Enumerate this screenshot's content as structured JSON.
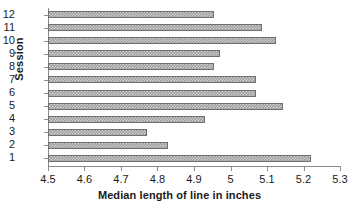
{
  "chart_data": {
    "type": "bar",
    "orientation": "horizontal",
    "title": "",
    "xlabel": "Median length of line in inches",
    "ylabel": "Session",
    "categories": [
      "1",
      "2",
      "3",
      "4",
      "5",
      "6",
      "7",
      "8",
      "9",
      "10",
      "11",
      "12"
    ],
    "values": [
      5.22,
      4.83,
      4.77,
      4.93,
      5.145,
      5.07,
      5.07,
      4.955,
      4.97,
      5.125,
      5.085,
      4.955
    ],
    "xlim": [
      4.5,
      5.3
    ],
    "xticks": [
      4.5,
      4.6,
      4.7,
      4.8,
      4.9,
      5,
      5.1,
      5.2,
      5.3
    ],
    "xtick_labels": [
      "4.5",
      "4.6",
      "4.7",
      "4.8",
      "4.9",
      "5",
      "5.1",
      "5.2",
      "5.3"
    ],
    "ytick_labels": [
      "12",
      "11",
      "10",
      "9",
      "8",
      "7",
      "6",
      "5",
      "4",
      "3",
      "2",
      "1"
    ],
    "grid": false,
    "legend": null,
    "bar_fill_color": "#9d9d9d",
    "bar_border_color": "#6f6f6f",
    "axis_color": "#8a8a8a",
    "text_color": "#1a1a1a"
  }
}
